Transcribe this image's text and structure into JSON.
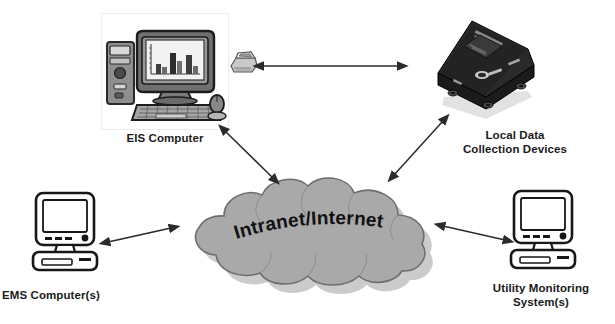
{
  "diagram": {
    "type": "network-topology",
    "background_color": "#ffffff",
    "cloud": {
      "label": "Intranet/Internet",
      "fill_color": "#a9a9a9",
      "outline_color": "#6e6e6e",
      "shadow_color": "#c9c9c9",
      "text_color": "#111111"
    },
    "nodes": [
      {
        "id": "eis-computer",
        "label": "EIS Computer",
        "icon": "desktop-computer-with-bar-chart-icon",
        "position": "top-left",
        "style": "grayscale-3d-illustration"
      },
      {
        "id": "modem-device",
        "label": "",
        "icon": "modem-icon",
        "position": "top-center-left",
        "style": "small-grayscale-icon"
      },
      {
        "id": "local-data-collection-devices",
        "label": "Local Data\nCollection Devices",
        "icon": "data-logger-box-icon",
        "position": "top-right",
        "style": "black-hardware-box"
      },
      {
        "id": "ems-computers",
        "label": "EMS Computer(s)",
        "icon": "crt-monitor-icon",
        "position": "bottom-left",
        "style": "line-art-outline"
      },
      {
        "id": "utility-monitoring-systems",
        "label": "Utility Monitoring\nSystem(s)",
        "icon": "crt-monitor-icon",
        "position": "bottom-right",
        "style": "line-art-outline"
      }
    ],
    "connections": [
      {
        "id": "modem-to-local-device",
        "from": "modem-device",
        "to": "local-data-collection-devices",
        "arrow": "double-headed",
        "orientation": "horizontal"
      },
      {
        "id": "eis-to-cloud",
        "from": "eis-computer",
        "to": "cloud",
        "arrow": "double-headed",
        "orientation": "diagonal-down-right"
      },
      {
        "id": "local-device-to-cloud",
        "from": "local-data-collection-devices",
        "to": "cloud",
        "arrow": "double-headed",
        "orientation": "diagonal-down-left"
      },
      {
        "id": "ems-to-cloud",
        "from": "ems-computers",
        "to": "cloud",
        "arrow": "double-headed",
        "orientation": "horizontal-right"
      },
      {
        "id": "cloud-to-utility",
        "from": "cloud",
        "to": "utility-monitoring-systems",
        "arrow": "double-headed",
        "orientation": "horizontal-right"
      }
    ]
  }
}
